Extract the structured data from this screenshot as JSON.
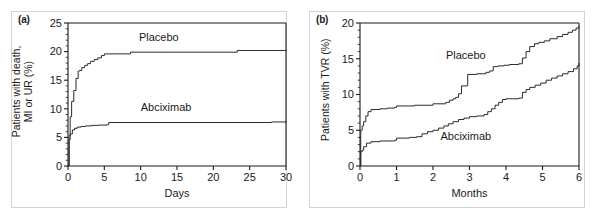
{
  "figure": {
    "panel_a_tag": "(a)",
    "panel_b_tag": "(b)"
  },
  "chart_data": [
    {
      "type": "line",
      "panel": "(a)",
      "title": "",
      "xlabel": "Days",
      "ylabel": "Patients with death,\nMI or UR (%)",
      "xlim": [
        0,
        30
      ],
      "ylim": [
        0,
        25
      ],
      "xticks": [
        0,
        5,
        10,
        15,
        20,
        25,
        30
      ],
      "yticks": [
        0,
        5,
        10,
        15,
        20,
        25
      ],
      "xtick_labels": [
        "0",
        "5",
        "10",
        "15",
        "20",
        "25",
        "30"
      ],
      "ytick_labels": [
        "0",
        "5",
        "10",
        "15",
        "20",
        "25"
      ],
      "grid": false,
      "legend": "inline-annotation",
      "annotations": [
        {
          "text": "Placebo",
          "x": 12.5,
          "y": 21.8
        },
        {
          "text": "Abciximab",
          "x": 13.5,
          "y": 9.6
        }
      ],
      "series": [
        {
          "name": "Placebo",
          "step": "post",
          "x": [
            0,
            0.15,
            0.3,
            0.5,
            0.8,
            1.1,
            1.4,
            1.6,
            1.9,
            2.3,
            2.7,
            3.1,
            3.6,
            4.1,
            4.6,
            5.0,
            8.6,
            23.3,
            30
          ],
          "values": [
            0,
            5.3,
            8.6,
            11.3,
            13.2,
            15.3,
            16.6,
            16.7,
            17.2,
            17.6,
            17.9,
            18.3,
            18.6,
            18.9,
            19.3,
            19.6,
            19.9,
            20.2,
            20.3
          ]
        },
        {
          "name": "Abciximab",
          "step": "post",
          "x": [
            0,
            0.15,
            0.3,
            0.6,
            0.9,
            1.3,
            1.8,
            2.4,
            3.2,
            4.2,
            5.4,
            5.6,
            28.0,
            30
          ],
          "values": [
            0,
            4.6,
            5.6,
            6.3,
            6.6,
            6.8,
            6.9,
            7.0,
            7.1,
            7.15,
            7.2,
            7.6,
            7.7,
            7.9
          ]
        }
      ]
    },
    {
      "type": "line",
      "panel": "(b)",
      "title": "",
      "xlabel": "Months",
      "ylabel": "Patients with TVR (%)",
      "xlim": [
        0,
        6
      ],
      "ylim": [
        0,
        20
      ],
      "xticks": [
        0,
        1,
        2,
        3,
        4,
        5,
        6
      ],
      "yticks": [
        0,
        5,
        10,
        15,
        20
      ],
      "xtick_labels": [
        "0",
        "1",
        "2",
        "3",
        "4",
        "5",
        "6"
      ],
      "ytick_labels": [
        "0",
        "5",
        "10",
        "15",
        "20"
      ],
      "grid": false,
      "legend": "inline-annotation",
      "annotations": [
        {
          "text": "Placebo",
          "x": 2.9,
          "y": 14.9
        },
        {
          "text": "Abciximab",
          "x": 2.9,
          "y": 3.6
        }
      ],
      "series": [
        {
          "name": "Placebo",
          "step": "post",
          "x": [
            0,
            0.02,
            0.06,
            0.1,
            0.16,
            0.22,
            0.3,
            0.55,
            0.75,
            0.95,
            1.0,
            1.5,
            2.0,
            2.35,
            2.45,
            2.55,
            2.62,
            2.7,
            2.78,
            2.95,
            3.2,
            3.45,
            3.55,
            3.65,
            3.78,
            3.95,
            4.1,
            4.35,
            4.45,
            4.55,
            4.65,
            4.78,
            4.9,
            5.05,
            5.2,
            5.4,
            5.55,
            5.7,
            5.82,
            5.92,
            6.0
          ],
          "values": [
            0,
            5.0,
            5.6,
            6.2,
            7.0,
            7.6,
            7.9,
            8.0,
            8.1,
            8.2,
            8.4,
            8.5,
            8.7,
            8.9,
            9.2,
            9.4,
            9.6,
            10.1,
            11.2,
            12.8,
            12.9,
            13.1,
            13.3,
            13.9,
            14.0,
            14.1,
            14.2,
            14.3,
            15.1,
            16.0,
            16.7,
            17.1,
            17.3,
            17.5,
            17.8,
            18.1,
            18.4,
            18.7,
            19.0,
            19.3,
            19.6
          ]
        },
        {
          "name": "Abciximab",
          "step": "post",
          "x": [
            0,
            0.02,
            0.06,
            0.1,
            0.18,
            0.3,
            0.55,
            0.95,
            1.0,
            1.35,
            1.55,
            1.7,
            1.85,
            2.0,
            2.15,
            2.3,
            2.42,
            2.55,
            2.7,
            2.85,
            3.0,
            3.2,
            3.4,
            3.5,
            3.6,
            3.7,
            3.8,
            3.9,
            4.0,
            4.35,
            4.45,
            4.55,
            4.65,
            4.8,
            4.95,
            5.1,
            5.25,
            5.4,
            5.55,
            5.7,
            5.85,
            5.95,
            6.0
          ],
          "values": [
            0,
            2.0,
            2.2,
            2.7,
            3.2,
            3.4,
            3.5,
            3.6,
            3.9,
            4.0,
            4.1,
            4.5,
            4.8,
            5.0,
            5.3,
            5.6,
            5.9,
            6.2,
            6.5,
            6.7,
            6.9,
            7.0,
            7.2,
            7.6,
            8.0,
            8.5,
            8.9,
            9.3,
            9.4,
            9.5,
            10.3,
            10.7,
            11.0,
            11.3,
            11.6,
            12.0,
            12.3,
            12.6,
            12.9,
            13.2,
            13.6,
            14.0,
            14.4
          ]
        }
      ]
    }
  ]
}
